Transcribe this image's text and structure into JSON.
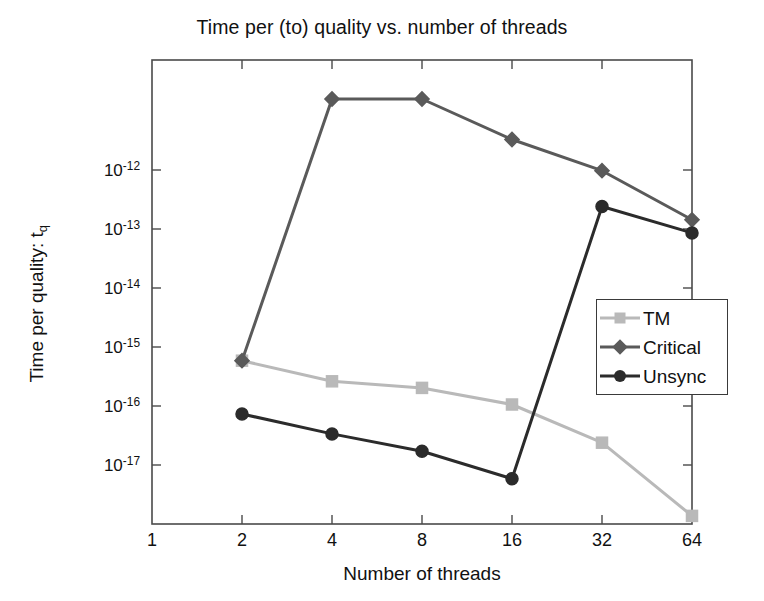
{
  "chart_data": {
    "type": "line",
    "title": "Time per (to) quality vs. number of threads",
    "xlabel": "Number of threads",
    "ylabel": "Time per quality: t",
    "ylabel_sub": "q",
    "xscale": "log2",
    "yscale": "log10",
    "grid": false,
    "legend_position": "center-right",
    "xticks": [
      "1",
      "2",
      "4",
      "8",
      "16",
      "32",
      "64"
    ],
    "xtick_values": [
      1,
      2,
      4,
      8,
      16,
      32,
      64
    ],
    "xlim": [
      1,
      64
    ],
    "yticks": [
      "-12",
      "-13",
      "-14",
      "-15",
      "-16",
      "-17"
    ],
    "ytick_values": [
      1e-12,
      1e-13,
      1e-14,
      1e-15,
      1e-16,
      1e-17
    ],
    "ytick_mantissa": "10",
    "ylim": [
      1.5e-18,
      2.2e-11
    ],
    "x": [
      2,
      4,
      8,
      16,
      32,
      64
    ],
    "series": [
      {
        "name": "TM",
        "marker": "square",
        "color": "#b9b9b9",
        "values": [
          5e-16,
          2.4e-16,
          1.9e-16,
          1.05e-16,
          2.7e-17,
          2e-18
        ]
      },
      {
        "name": "Critical",
        "marker": "diamond",
        "color": "#5a5a5a",
        "values": [
          5e-16,
          5.5e-12,
          5.5e-12,
          1.3e-12,
          4.3e-13,
          7.5e-14
        ]
      },
      {
        "name": "Unsync",
        "marker": "circle",
        "color": "#2b2b2b",
        "values": [
          7.5e-17,
          3.7e-17,
          2e-17,
          7.5e-18,
          1.2e-13,
          4.7e-14
        ]
      }
    ]
  },
  "legend": {
    "items": [
      {
        "label": "TM"
      },
      {
        "label": "Critical"
      },
      {
        "label": "Unsync"
      }
    ]
  },
  "axes": {
    "frame_color": "#4a4a4a"
  }
}
